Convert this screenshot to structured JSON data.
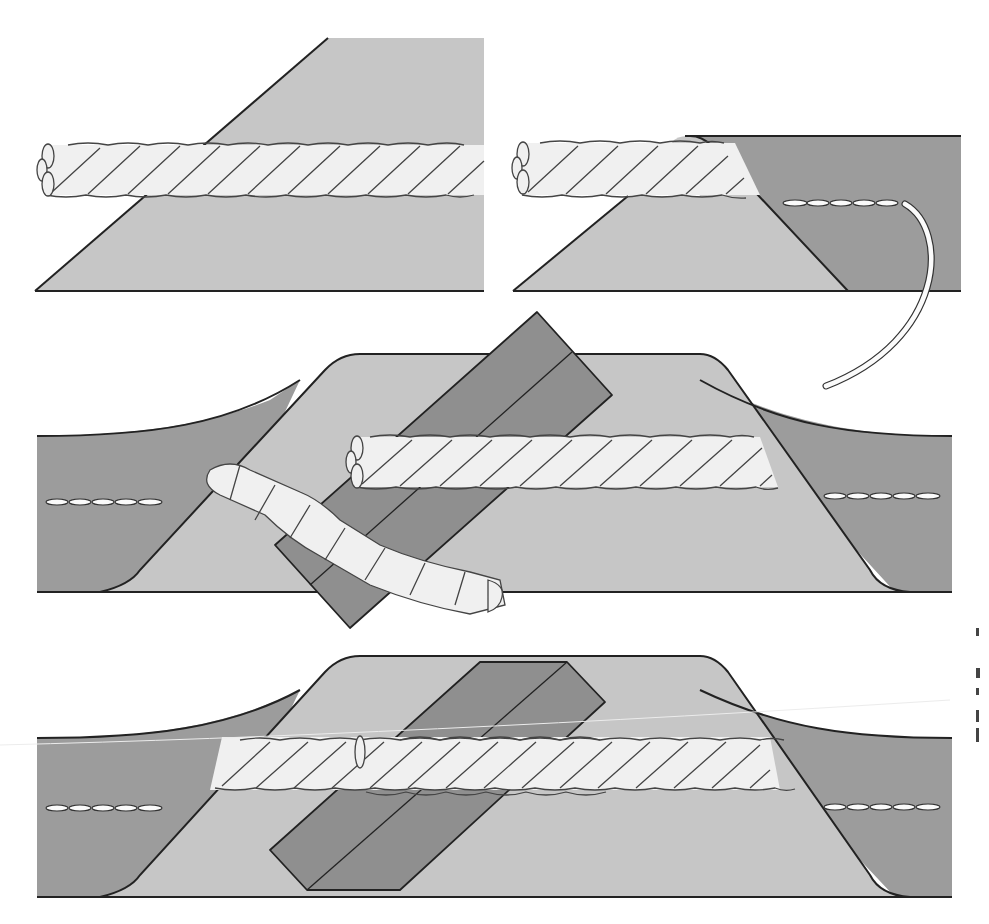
{
  "figure": {
    "colors": {
      "background": "#ffffff",
      "fabric_light": "#c6c6c6",
      "fabric_dark": "#9c9c9c",
      "fabric_strip": "#8f8f8f",
      "cord": "#f0f0f0",
      "outline": "#222222"
    },
    "panels": [
      {
        "id": "step-1",
        "description": "Twisted cord laid on wrong side of angled bias strip"
      },
      {
        "id": "step-2",
        "description": "Bias strip folded over cord and stitched close to cord with thread"
      },
      {
        "id": "step-3",
        "description": "Piping ends overlapped with cord unwrapped and strip end folded diagonally"
      },
      {
        "id": "step-4",
        "description": "Cord ends butted together inside folded strip and joined piping"
      }
    ],
    "right_margin_text": {
      "note": "Cropped text fragments at right margin (unreadable)",
      "fragments": [
        "",
        "",
        "",
        "",
        ""
      ]
    }
  }
}
